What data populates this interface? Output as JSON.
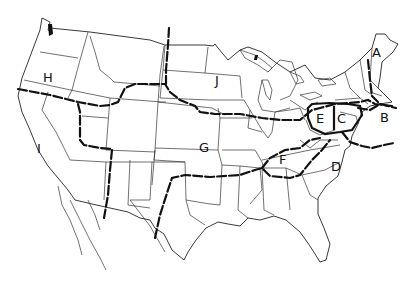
{
  "map": {
    "type": "regional map of the contiguous United States",
    "regions": [
      {
        "id": "A",
        "label": "A",
        "x": 378,
        "y": 52
      },
      {
        "id": "B",
        "label": "B",
        "x": 383,
        "y": 118
      },
      {
        "id": "C",
        "label": "C",
        "x": 341,
        "y": 118
      },
      {
        "id": "D",
        "label": "D",
        "x": 335,
        "y": 166
      },
      {
        "id": "E",
        "label": "E",
        "x": 320,
        "y": 118
      },
      {
        "id": "F",
        "label": "F",
        "x": 283,
        "y": 159
      },
      {
        "id": "G",
        "label": "G",
        "x": 203,
        "y": 147
      },
      {
        "id": "H",
        "label": "H",
        "x": 48,
        "y": 77
      },
      {
        "id": "I",
        "label": "I",
        "x": 40,
        "y": 148
      },
      {
        "id": "J",
        "label": "J",
        "x": 219,
        "y": 80
      }
    ],
    "colors": {
      "line": "#111111",
      "background": "#ffffff"
    }
  }
}
